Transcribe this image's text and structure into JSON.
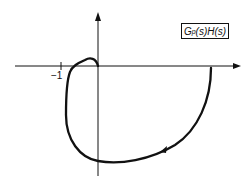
{
  "diagram": {
    "transfer_function_label": {
      "G": "G",
      "sub": "p",
      "rest": "(s)H(s)"
    },
    "tick_label": "−1",
    "axes": {
      "horizontal": "real axis",
      "vertical": "imaginary axis"
    },
    "colors": {
      "stroke": "#111111",
      "background": "#ffffff"
    }
  }
}
